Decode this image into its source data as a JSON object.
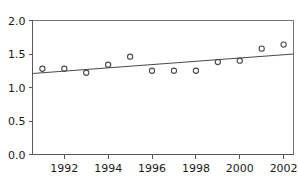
{
  "chart_data": {
    "type": "scatter",
    "title": "",
    "subtitle": "",
    "xlabel": "",
    "ylabel": "",
    "xlim": [
      1990.55,
      2002.45
    ],
    "ylim": [
      0.0,
      2.0
    ],
    "grid": false,
    "legend": null,
    "x": [
      1991,
      1992,
      1993,
      1994,
      1995,
      1996,
      1997,
      1998,
      1999,
      2000,
      2001,
      2002
    ],
    "values": [
      1.28,
      1.28,
      1.22,
      1.34,
      1.46,
      1.25,
      1.25,
      1.25,
      1.38,
      1.4,
      1.58,
      1.64
    ],
    "series": [
      {
        "name": "observations",
        "marker": "open-circle",
        "color": "#4a4a4a",
        "values": [
          1.28,
          1.28,
          1.22,
          1.34,
          1.46,
          1.25,
          1.25,
          1.25,
          1.38,
          1.4,
          1.58,
          1.64
        ]
      },
      {
        "name": "trend-line",
        "type": "line",
        "color": "#4a4a4a",
        "endpoints": [
          {
            "x": 1990.55,
            "y": 1.21
          },
          {
            "x": 2002.45,
            "y": 1.5
          }
        ]
      }
    ],
    "xticks": [
      1992,
      1994,
      1996,
      1998,
      2000,
      2002
    ],
    "xtick_labels": [
      "1992",
      "1994",
      "1996",
      "1998",
      "2000",
      "2002"
    ],
    "yticks": [
      0.0,
      0.5,
      1.0,
      1.5,
      2.0
    ],
    "ytick_labels": [
      "0.0",
      "0.5",
      "1.0",
      "1.5",
      "2.0"
    ],
    "colors": {
      "axis": "#595959",
      "frame": "#767676",
      "marker": "#4a4a4a",
      "line": "#4a4a4a",
      "background": "#ffffff",
      "text": "#1a1a1a"
    }
  }
}
